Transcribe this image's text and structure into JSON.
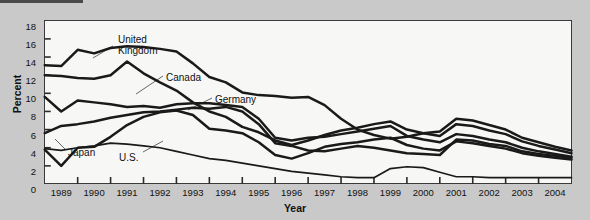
{
  "figure": {
    "top_rule": "",
    "background_color": "#c9c9c9",
    "plot_background": "#f7f7f5"
  },
  "chart_data": {
    "type": "line",
    "title": "",
    "xlabel": "Year",
    "ylabel": "Percent",
    "ylim": [
      0,
      18
    ],
    "ytick_step": 2,
    "yticks": [
      "0",
      "2",
      "4",
      "6",
      "8",
      "10",
      "12",
      "14",
      "16",
      "18"
    ],
    "grid": false,
    "legend": "inline-annotations",
    "x": [
      "1988.5",
      "1989",
      "1989.5",
      "1990",
      "1990.5",
      "1991",
      "1991.5",
      "1992",
      "1992.5",
      "1993",
      "1993.5",
      "1994",
      "1994.5",
      "1995",
      "1995.5",
      "1996",
      "1996.5",
      "1997",
      "1997.5",
      "1998",
      "1998.5",
      "1999",
      "1999.5",
      "2000",
      "2000.5",
      "2001",
      "2001.5",
      "2002",
      "2002.5",
      "2003",
      "2003.5",
      "2004",
      "2004.5"
    ],
    "xtick_labels": [
      "1989",
      "1990",
      "1991",
      "1992",
      "1993",
      "1994",
      "1995",
      "1996",
      "1997",
      "1998",
      "1999",
      "2000",
      "2001",
      "2002",
      "2003",
      "2004"
    ],
    "series": [
      {
        "name": "United Kingdom",
        "label": "United\nKingdom",
        "color": "#1a1a1a",
        "values": [
          13.1,
          13.0,
          14.8,
          14.4,
          15.0,
          15.2,
          15.1,
          14.9,
          14.6,
          13.3,
          11.8,
          11.2,
          10.1,
          9.8,
          9.7,
          9.5,
          9.6,
          8.7,
          7.2,
          6.0,
          5.4,
          5.0,
          5.2,
          5.6,
          5.8,
          7.2,
          7.0,
          6.5,
          6.0,
          5.1,
          4.6,
          4.1,
          3.7
        ]
      },
      {
        "name": "Canada",
        "label": "Canada",
        "color": "#1a1a1a",
        "values": [
          12.0,
          11.9,
          11.7,
          11.6,
          12.0,
          13.5,
          12.2,
          11.2,
          10.3,
          9.0,
          8.0,
          7.4,
          6.3,
          5.7,
          4.8,
          4.3,
          4.8,
          5.4,
          5.9,
          6.2,
          6.6,
          6.9,
          6.0,
          5.6,
          5.3,
          6.6,
          6.4,
          5.9,
          5.5,
          4.7,
          4.2,
          3.8,
          3.4
        ]
      },
      {
        "name": "Germany",
        "label": "Germany",
        "color": "#1a1a1a",
        "values": [
          9.6,
          8.0,
          9.2,
          9.0,
          8.8,
          8.5,
          8.6,
          8.4,
          8.8,
          8.9,
          8.9,
          8.7,
          8.5,
          7.2,
          5.1,
          4.8,
          5.1,
          5.2,
          5.5,
          5.8,
          6.1,
          6.4,
          5.3,
          4.9,
          4.6,
          5.5,
          5.3,
          4.9,
          4.6,
          4.0,
          3.6,
          3.3,
          3.0
        ]
      },
      {
        "name": "Japan",
        "label": "Japan",
        "color": "#1a1a1a",
        "values": [
          5.6,
          6.4,
          6.6,
          6.9,
          7.3,
          7.6,
          7.9,
          8.0,
          8.2,
          8.4,
          8.3,
          8.5,
          8.0,
          6.6,
          4.5,
          4.2,
          3.7,
          3.6,
          3.9,
          4.2,
          4.0,
          3.7,
          3.4,
          3.3,
          3.2,
          4.9,
          4.8,
          4.4,
          4.2,
          3.6,
          3.3,
          3.1,
          2.9
        ]
      },
      {
        "name": "U.S.",
        "label": "U.S.",
        "color": "#1a1a1a",
        "values": [
          3.8,
          2.0,
          4.0,
          4.1,
          5.2,
          6.5,
          7.4,
          7.9,
          8.1,
          7.6,
          6.1,
          5.9,
          5.6,
          4.6,
          3.2,
          2.8,
          3.4,
          4.1,
          4.4,
          4.6,
          4.9,
          5.1,
          4.3,
          3.9,
          3.7,
          4.7,
          4.5,
          4.2,
          3.9,
          3.4,
          3.1,
          2.9,
          2.7
        ]
      },
      {
        "name": "lowest-line",
        "label": "",
        "color": "#1a1a1a",
        "values": [
          3.9,
          3.7,
          4.0,
          4.2,
          4.5,
          4.4,
          4.2,
          4.0,
          3.6,
          3.2,
          2.8,
          2.6,
          2.3,
          2.0,
          1.7,
          1.4,
          1.2,
          1.0,
          0.8,
          0.7,
          0.7,
          1.7,
          1.9,
          1.8,
          1.3,
          0.8,
          0.8,
          0.7,
          0.7,
          0.7,
          0.7,
          0.7,
          0.7
        ]
      }
    ],
    "annotations": [
      {
        "name": "united-kingdom",
        "text": "United\nKingdom",
        "x_px": 118,
        "y_px": 28
      },
      {
        "name": "canada",
        "text": "Canada",
        "x_px": 166,
        "y_px": 66
      },
      {
        "name": "germany",
        "text": "Germany",
        "x_px": 215,
        "y_px": 88
      },
      {
        "name": "japan",
        "text": "Japan",
        "x_px": 68,
        "y_px": 141
      },
      {
        "name": "us",
        "text": "U.S.",
        "x_px": 119,
        "y_px": 146
      }
    ]
  }
}
